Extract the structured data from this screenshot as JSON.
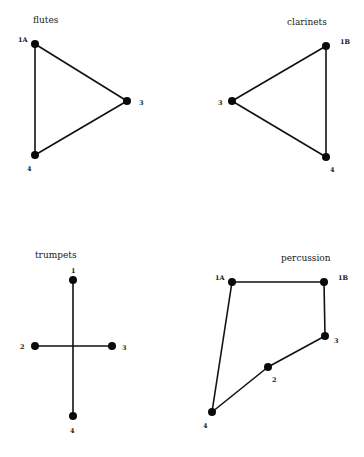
{
  "diagrams": [
    {
      "title": "flutes",
      "nodes": [
        {
          "id": "1A",
          "label": "1A"
        },
        {
          "id": "3",
          "label": "3"
        },
        {
          "id": "4",
          "label": "4"
        }
      ],
      "edges": [
        [
          "1A",
          "3"
        ],
        [
          "3",
          "4"
        ],
        [
          "4",
          "1A"
        ]
      ]
    },
    {
      "title": "clarinets",
      "nodes": [
        {
          "id": "1B",
          "label": "1B"
        },
        {
          "id": "3",
          "label": "3"
        },
        {
          "id": "4",
          "label": "4"
        }
      ],
      "edges": [
        [
          "1B",
          "3"
        ],
        [
          "3",
          "4"
        ],
        [
          "4",
          "1B"
        ]
      ]
    },
    {
      "title": "trumpets",
      "nodes": [
        {
          "id": "1",
          "label": "1"
        },
        {
          "id": "2",
          "label": "2"
        },
        {
          "id": "3",
          "label": "3"
        },
        {
          "id": "4",
          "label": "4"
        }
      ],
      "edges": [
        [
          "1",
          "4"
        ],
        [
          "2",
          "3"
        ]
      ]
    },
    {
      "title": "percussion",
      "nodes": [
        {
          "id": "1A",
          "label": "1A"
        },
        {
          "id": "1B",
          "label": "1B"
        },
        {
          "id": "3",
          "label": "3"
        },
        {
          "id": "2",
          "label": "2"
        },
        {
          "id": "4",
          "label": "4"
        }
      ],
      "edges": [
        [
          "1A",
          "1B"
        ],
        [
          "1B",
          "3"
        ],
        [
          "3",
          "2"
        ],
        [
          "2",
          "4"
        ],
        [
          "4",
          "1A"
        ]
      ]
    }
  ]
}
